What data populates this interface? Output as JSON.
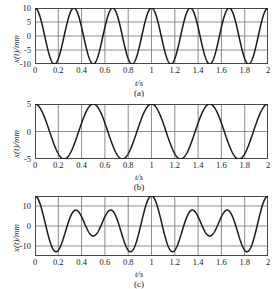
{
  "figure": {
    "background": "#ffffff",
    "curve_color": "#1a1a1a",
    "grid_color": "#6e6e6e",
    "frame_color": "#4a4a4a"
  },
  "panels": [
    {
      "id": "a",
      "caption": "(a)",
      "ylabel": "x(t)/mm",
      "xlabel": "t/s",
      "yticks": [
        "10",
        "5",
        "0",
        "-5",
        "-10"
      ],
      "ytick_values": [
        10,
        5,
        0,
        -5,
        -10
      ],
      "xticks": [
        "0",
        "0.2",
        "0.4",
        "0.6",
        "0.8",
        "1",
        "1.2",
        "1.4",
        "1.6",
        "1.8",
        "2"
      ],
      "xtick_values": [
        0,
        0.2,
        0.4,
        0.6,
        0.8,
        1,
        1.2,
        1.4,
        1.6,
        1.8,
        2
      ]
    },
    {
      "id": "b",
      "caption": "(b)",
      "ylabel": "x(t)/mm",
      "xlabel": "t/s",
      "yticks": [
        "5",
        "0",
        "-5"
      ],
      "ytick_values": [
        5,
        0,
        -5
      ],
      "xticks": [
        "0",
        "0.2",
        "0.4",
        "0.6",
        "0.8",
        "1",
        "1.2",
        "1.4",
        "1.6",
        "1.8",
        "2"
      ],
      "xtick_values": [
        0,
        0.2,
        0.4,
        0.6,
        0.8,
        1,
        1.2,
        1.4,
        1.6,
        1.8,
        2
      ]
    },
    {
      "id": "c",
      "caption": "(c)",
      "ylabel": "x(t)/mm",
      "xlabel": "t/s",
      "yticks": [
        "10",
        "0",
        "-10"
      ],
      "ytick_values": [
        10,
        0,
        -10
      ],
      "xticks": [
        "0",
        "0.2",
        "0.4",
        "0.6",
        "0.8",
        "1",
        "1.2",
        "1.4",
        "1.6",
        "1.8",
        "2"
      ],
      "xtick_values": [
        0,
        0.2,
        0.4,
        0.6,
        0.8,
        1,
        1.2,
        1.4,
        1.6,
        1.8,
        2
      ]
    }
  ],
  "chart_data": [
    {
      "type": "line",
      "panel": "a",
      "title": "(a)",
      "xlabel": "t/s",
      "ylabel": "x(t)/mm",
      "xlim": [
        0,
        2
      ],
      "ylim": [
        -10,
        10
      ],
      "xticks": [
        0,
        0.2,
        0.4,
        0.6,
        0.8,
        1,
        1.2,
        1.4,
        1.6,
        1.8,
        2
      ],
      "yticks": [
        -10,
        -5,
        0,
        5,
        10
      ],
      "grid": true,
      "legend": "none",
      "series": [
        {
          "name": "x1",
          "equation": "x1(t) = 10*cos(2*pi*3*t)",
          "amplitude": 10,
          "frequency_hz": 3,
          "period_s": 0.3333,
          "phase_rad": 0,
          "cycles_shown": 6
        }
      ]
    },
    {
      "type": "line",
      "panel": "b",
      "title": "(b)",
      "xlabel": "t/s",
      "ylabel": "x(t)/mm",
      "xlim": [
        0,
        2
      ],
      "ylim": [
        -5,
        5
      ],
      "xticks": [
        0,
        0.2,
        0.4,
        0.6,
        0.8,
        1,
        1.2,
        1.4,
        1.6,
        1.8,
        2
      ],
      "yticks": [
        -5,
        0,
        5
      ],
      "grid": true,
      "legend": "none",
      "series": [
        {
          "name": "x2",
          "equation": "x2(t) = 5*cos(2*pi*2*t)",
          "amplitude": 5,
          "frequency_hz": 2,
          "period_s": 0.5,
          "phase_rad": 0,
          "cycles_shown": 4
        }
      ]
    },
    {
      "type": "line",
      "panel": "c",
      "title": "(c)",
      "xlabel": "t/s",
      "ylabel": "x(t)/mm",
      "xlim": [
        0,
        2
      ],
      "ylim": [
        -15,
        15
      ],
      "xticks": [
        0,
        0.2,
        0.4,
        0.6,
        0.8,
        1,
        1.2,
        1.4,
        1.6,
        1.8,
        2
      ],
      "yticks": [
        -10,
        0,
        10
      ],
      "grid": true,
      "legend": "none",
      "series": [
        {
          "name": "x1+x2",
          "equation": "x(t) = 10*cos(2*pi*3*t) + 5*cos(2*pi*2*t)",
          "amplitude_max": 15,
          "beat_frequency_hz": 1,
          "beat_period_s": 1,
          "cycles_shown": 2
        }
      ]
    }
  ]
}
